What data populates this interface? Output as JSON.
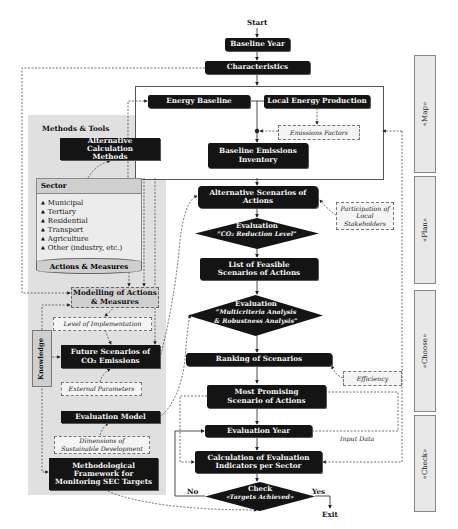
{
  "flow": {
    "start": "Start",
    "baseline_year": "Baseline Year",
    "characteristics": "Characteristics",
    "energy_baseline": "Energy Baseline",
    "local_energy_production": "Local Energy Production",
    "emissions_factors": "Emissions Factors",
    "baseline_emissions_inventory": "Baseline Emissions Inventory",
    "alternative_scenarios": "Alternative Scenarios of Actions",
    "participation": "Participation of Local Stakeholders",
    "eval1_title": "Evaluation",
    "eval1_sub": "“CO₂ Reduction Level”",
    "list_feasible": "List of Feasible Scenarios of Actions",
    "eval2_title": "Evaluation",
    "eval2_sub1": "“Multicriteria Analysis",
    "eval2_sub2": "& Robustness Analysis”",
    "ranking": "Ranking of Scenarios",
    "efficiency": "Efficiency",
    "most_promising": "Most Promising Scenario of Actions",
    "evaluation_year": "Evaluation Year",
    "input_data": "Input Data",
    "calculation": "Calculation of Evaluation Indicators per Sector",
    "check_title": "Check",
    "check_sub": "«Targets Achieved»",
    "no": "No",
    "yes": "Yes",
    "exit": "Exit"
  },
  "methods": {
    "title": "Methods & Tools",
    "alt_calc": "Alternative Calculation Methods",
    "sector_title": "Sector",
    "sectors": [
      "Municipal",
      "Tertiary",
      "Residential",
      "Transport",
      "Agriculture",
      "Other (industry, etc.)"
    ],
    "actions_measures": "Actions & Measures",
    "modelling": "Modelling of Actions & Measures",
    "level_impl": "Level of Implementation",
    "knowledge": "Knowledge",
    "future_scenarios": "Future Scenarios of CO₂ Emissions",
    "external_params": "External Parameters",
    "evaluation_model": "Evaluation Model",
    "dimensions": "Dimensions of Sustainable Development",
    "methodological": "Methodological Framework for Monitoring SEC Targets"
  },
  "phases": [
    "«Map»",
    "«Plan»",
    "«Choose»",
    "«Check»"
  ]
}
